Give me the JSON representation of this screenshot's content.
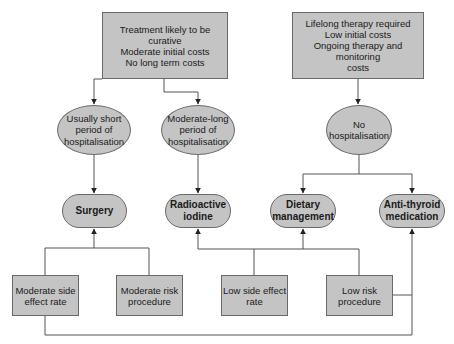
{
  "diagram": {
    "top_boxes": [
      {
        "id": "curative",
        "text": "Treatment likely to be curative\nModerate initial costs\nNo long term costs"
      },
      {
        "id": "lifelong",
        "text": "Lifelong therapy required\nLow initial costs\nOngoing therapy and monitoring\ncosts"
      }
    ],
    "hospitalisation": [
      {
        "id": "short",
        "text": "Usually short\nperiod of\nhospitalisation"
      },
      {
        "id": "moderate-long",
        "text": "Moderate-long\nperiod of\nhospitalisation"
      },
      {
        "id": "none",
        "text": "No\nhospitalisation"
      }
    ],
    "treatments": [
      {
        "id": "surgery",
        "text": "Surgery"
      },
      {
        "id": "radioactive-iodine",
        "text": "Radioactive\niodine"
      },
      {
        "id": "dietary",
        "text": "Dietary\nmanagement"
      },
      {
        "id": "anti-thyroid",
        "text": "Anti-thyroid\nmedication"
      }
    ],
    "attributes": [
      {
        "id": "moderate-side-effect",
        "text": "Moderate side\neffect rate"
      },
      {
        "id": "moderate-risk",
        "text": "Moderate risk\nprocedure"
      },
      {
        "id": "low-side-effect",
        "text": "Low side effect\nrate"
      },
      {
        "id": "low-risk",
        "text": "Low risk\nprocedure"
      }
    ],
    "edges": [
      {
        "from": "curative",
        "to": "short"
      },
      {
        "from": "curative",
        "to": "moderate-long"
      },
      {
        "from": "lifelong",
        "to": "none"
      },
      {
        "from": "short",
        "to": "surgery"
      },
      {
        "from": "moderate-long",
        "to": "radioactive-iodine"
      },
      {
        "from": "none",
        "to": "dietary"
      },
      {
        "from": "none",
        "to": "anti-thyroid"
      },
      {
        "from": "moderate-side-effect",
        "to": "surgery"
      },
      {
        "from": "moderate-risk",
        "to": "surgery"
      },
      {
        "from": "low-side-effect",
        "to": "radioactive-iodine"
      },
      {
        "from": "low-side-effect",
        "to": "dietary"
      },
      {
        "from": "low-risk",
        "to": "dietary"
      },
      {
        "from": "low-risk",
        "to": "anti-thyroid"
      },
      {
        "from": "moderate-side-effect",
        "to": "anti-thyroid"
      }
    ],
    "colors": {
      "fill": "#c4c4c4",
      "stroke": "#6a6a6a",
      "line": "#555555"
    }
  }
}
